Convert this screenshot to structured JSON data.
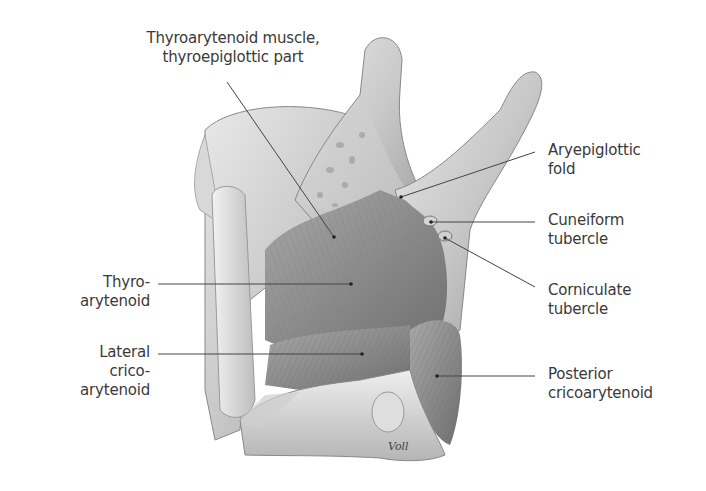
{
  "figure": {
    "artist_signature": "Voll",
    "labels": {
      "thyroarytenoid_thyroepiglottic": {
        "line1": "Thyroarytenoid muscle,",
        "line2": "thyroepiglottic part"
      },
      "aryepiglottic_fold": {
        "line1": "Aryepiglottic",
        "line2": "fold"
      },
      "cuneiform_tubercle": {
        "line1": "Cuneiform",
        "line2": "tubercle"
      },
      "corniculate_tubercle": {
        "line1": "Corniculate",
        "line2": "tubercle"
      },
      "posterior_cricoarytenoid": {
        "line1": "Posterior",
        "line2": "cricoarytenoid"
      },
      "thyroarytenoid": {
        "line1": "Thyro-",
        "line2": "arytenoid"
      },
      "lateral_cricoarytenoid": {
        "line1": "Lateral",
        "line2": "crico-",
        "line3": "arytenoid"
      }
    },
    "colors": {
      "text": "#3a3a3a",
      "leader_line": "#444444",
      "background": "#ffffff"
    }
  }
}
